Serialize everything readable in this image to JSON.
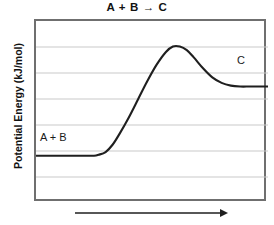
{
  "chart_data": {
    "type": "line",
    "title": "A + B → C",
    "xlabel": "",
    "ylabel": "Potential Energy (kJ/mol)",
    "grid": true,
    "legend": false,
    "xlim": [
      0,
      100
    ],
    "ylim": [
      0,
      100
    ],
    "gridline_count": 7,
    "annotations": [
      {
        "text": "A + B",
        "x": 8,
        "y": 30
      },
      {
        "text": "C",
        "x": 90,
        "y": 62
      }
    ],
    "series": [
      {
        "name": "reaction-energy-profile",
        "x": [
          0,
          5,
          10,
          15,
          20,
          25,
          27,
          30,
          33,
          36,
          40,
          44,
          48,
          52,
          56,
          59,
          62,
          65,
          68,
          72,
          76,
          80,
          84,
          88,
          92,
          96,
          100
        ],
        "y": [
          26,
          26,
          26,
          26,
          26,
          26,
          26.5,
          28,
          32,
          38,
          47,
          57,
          67,
          76,
          83,
          86,
          86,
          84,
          80,
          74,
          69,
          66,
          64.5,
          64,
          64,
          64,
          64
        ]
      }
    ],
    "levels": {
      "reactant_energy": 26,
      "transition_state_energy": 86,
      "product_energy": 64,
      "activation_energy": 60,
      "reaction_enthalpy": 38
    }
  },
  "figure": {
    "title": "A + B → C",
    "y_axis_label": "Potential Energy (kJ/mol)",
    "reactant_label": "A + B",
    "product_label": "C",
    "x_axis_arrow_name": "reaction-progress-arrow"
  },
  "colors": {
    "curve": "#1f1f1f",
    "frame": "#6f6f6f",
    "gridline": "#c9c9c9",
    "text": "#121212",
    "background": "#ffffff"
  }
}
